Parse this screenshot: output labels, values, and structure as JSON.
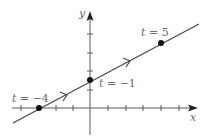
{
  "figure": {
    "axes": {
      "x_label": "x",
      "y_label": "y"
    },
    "line": {
      "description": "parametric line with direction arrows"
    },
    "points": [
      {
        "t_var": "t",
        "eq": "=",
        "value": "−4"
      },
      {
        "t_var": "t",
        "eq": "=",
        "value": "−1"
      },
      {
        "t_var": "t",
        "eq": "=",
        "value": "5"
      }
    ],
    "colors": {
      "line": "#4a4a4a",
      "axis": "#5a5a5a",
      "point": "#111111",
      "label": "#6a6a6a"
    }
  }
}
